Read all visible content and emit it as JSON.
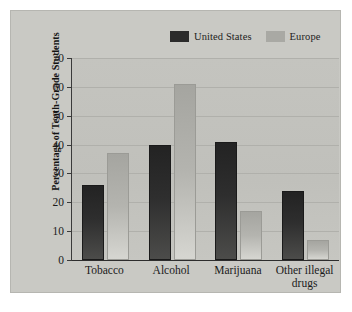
{
  "chart_data": {
    "type": "bar",
    "title": "",
    "xlabel": "",
    "ylabel": "Percentage of Tenth-Grade Students",
    "ylim": [
      0,
      70
    ],
    "yticks": [
      0,
      10,
      20,
      30,
      40,
      50,
      60,
      70
    ],
    "ytick_labels": [
      "0",
      "10",
      "20",
      "30",
      "40",
      "50",
      "60",
      "70"
    ],
    "grid": true,
    "legend_position": "top-right",
    "categories": [
      "Tobacco",
      "Alcohol",
      "Marijuana",
      "Other illegal drugs"
    ],
    "category_lines": [
      [
        "Tobacco"
      ],
      [
        "Alcohol"
      ],
      [
        "Marijuana"
      ],
      [
        "Other illegal",
        "drugs"
      ]
    ],
    "series": [
      {
        "name": "United States",
        "color": "#2b2b2b",
        "values": [
          26,
          40,
          41,
          24
        ]
      },
      {
        "name": "Europe",
        "color": "#a9a9a4",
        "values": [
          37,
          61,
          17,
          7
        ]
      }
    ]
  },
  "legend": {
    "entries": [
      {
        "label": "United States"
      },
      {
        "label": "Europe"
      }
    ]
  },
  "colors": {
    "background": "#ffffff",
    "card": "#c9c9c4",
    "plot": "#c2c2bd",
    "axis": "#2d2d2d",
    "gridline": "#b0b0ab",
    "united_states": "#2b2b2b",
    "europe": "#a9a9a4",
    "text": "#1b1b1b"
  }
}
